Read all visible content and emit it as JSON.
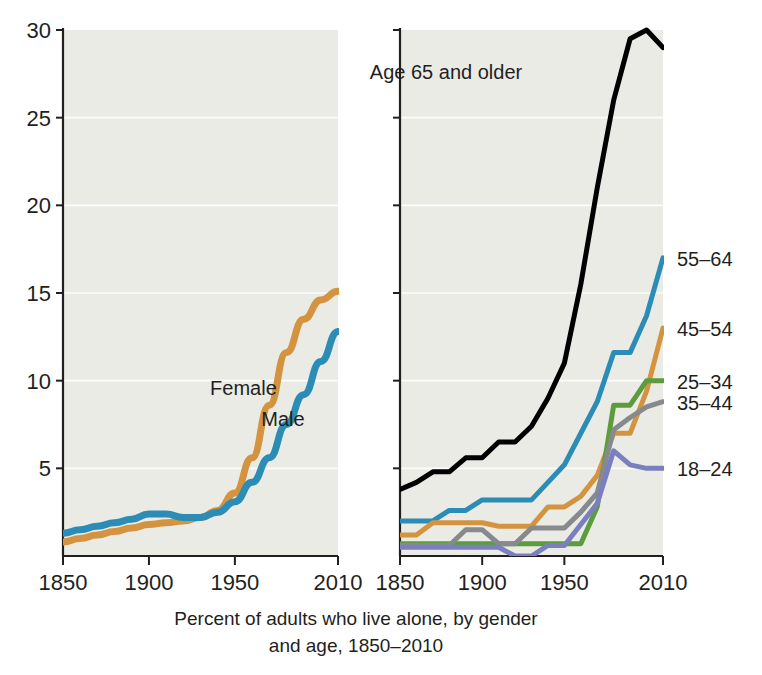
{
  "caption": {
    "line1": "Percent of adults who live alone, by gender",
    "line2": "and age, 1850–2010"
  },
  "axes": {
    "y_ticks": [
      "5",
      "10",
      "15",
      "20",
      "25",
      "30"
    ],
    "x_ticks": [
      "1850",
      "1900",
      "1950",
      "2010"
    ],
    "y_min": 0,
    "y_max": 30,
    "x_min": 1850,
    "x_max": 2010
  },
  "colors": {
    "orange": "#d4943f",
    "blue": "#2b8cb5",
    "black": "#000000",
    "green": "#5d9c3c",
    "gray": "#868a8c",
    "purple": "#7a80bf",
    "plot_background": "#ebebe6",
    "gridline": "#ffffff",
    "axis": "#231f20"
  },
  "chart_data": [
    {
      "type": "line",
      "title": "Percent of adults who live alone, by gender, 1850–2010",
      "xlabel": "",
      "ylabel": "Percent",
      "xlim": [
        1850,
        2010
      ],
      "ylim": [
        0,
        30
      ],
      "grid": true,
      "legend_position": "inline-labels",
      "x": [
        1850,
        1860,
        1870,
        1880,
        1890,
        1900,
        1910,
        1920,
        1930,
        1940,
        1950,
        1960,
        1970,
        1980,
        1990,
        2000,
        2010
      ],
      "series": [
        {
          "name": "Female",
          "color": "#d4943f",
          "label_x": 1955,
          "label_y": 9.2,
          "values": [
            0.8,
            1.0,
            1.2,
            1.4,
            1.6,
            1.8,
            1.9,
            2.0,
            2.2,
            2.6,
            3.6,
            5.6,
            8.6,
            11.6,
            13.5,
            14.6,
            15.1
          ]
        },
        {
          "name": "Male",
          "color": "#2b8cb5",
          "label_x": 1978,
          "label_y": 7.4,
          "values": [
            1.3,
            1.5,
            1.7,
            1.9,
            2.1,
            2.4,
            2.4,
            2.2,
            2.2,
            2.5,
            3.1,
            4.2,
            5.6,
            7.5,
            9.2,
            11.1,
            12.8
          ]
        }
      ]
    },
    {
      "type": "line",
      "title": "Percent of adults who live alone, by age, 1850–2010",
      "xlabel": "",
      "ylabel": "Percent",
      "xlim": [
        1850,
        2010
      ],
      "ylim": [
        0,
        30
      ],
      "grid": true,
      "legend_position": "right",
      "x": [
        1850,
        1860,
        1870,
        1880,
        1890,
        1900,
        1910,
        1920,
        1930,
        1940,
        1950,
        1960,
        1970,
        1980,
        1990,
        2000,
        2010
      ],
      "series": [
        {
          "name": "Age 65 and older",
          "color": "#000000",
          "label_x": 1878,
          "label_y": 27.2,
          "inline_label": true,
          "values": [
            3.8,
            4.2,
            4.8,
            4.8,
            5.6,
            5.6,
            6.5,
            6.5,
            7.4,
            9.0,
            11.0,
            15.5,
            21.0,
            26.0,
            29.5,
            30.0,
            29.0
          ]
        },
        {
          "name": "55–64",
          "color": "#2b8cb5",
          "label_x": 2010,
          "label_y": 17.0,
          "inline_label": false,
          "values": [
            2.0,
            2.0,
            2.0,
            2.6,
            2.6,
            3.2,
            3.2,
            3.2,
            3.2,
            4.2,
            5.2,
            7.0,
            8.8,
            11.6,
            11.6,
            13.7,
            17.0
          ]
        },
        {
          "name": "45–54",
          "color": "#d4943f",
          "label_x": 2010,
          "label_y": 13.0,
          "inline_label": false,
          "values": [
            1.2,
            1.2,
            1.9,
            1.9,
            1.9,
            1.9,
            1.7,
            1.7,
            1.7,
            2.8,
            2.8,
            3.4,
            4.6,
            7.0,
            7.0,
            9.4,
            13.0
          ]
        },
        {
          "name": "25–34",
          "color": "#5d9c3c",
          "label_x": 2010,
          "label_y": 10.0,
          "inline_label": false,
          "values": [
            0.7,
            0.7,
            0.7,
            0.7,
            0.7,
            0.7,
            0.7,
            0.7,
            0.7,
            0.7,
            0.7,
            0.7,
            2.8,
            8.6,
            8.6,
            10.0,
            10.0
          ]
        },
        {
          "name": "35–44",
          "color": "#868a8c",
          "label_x": 2010,
          "label_y": 8.8,
          "inline_label": false,
          "values": [
            0.6,
            0.6,
            0.6,
            0.6,
            1.5,
            1.5,
            0.7,
            0.7,
            1.6,
            1.6,
            1.6,
            2.5,
            3.6,
            7.2,
            7.9,
            8.5,
            8.8
          ]
        },
        {
          "name": "18–24",
          "color": "#7a80bf",
          "label_x": 2010,
          "label_y": 5.0,
          "inline_label": false,
          "values": [
            0.5,
            0.5,
            0.5,
            0.5,
            0.5,
            0.5,
            0.5,
            0.0,
            0.0,
            0.6,
            0.6,
            1.8,
            3.0,
            6.0,
            5.2,
            5.0,
            5.0
          ]
        }
      ]
    }
  ]
}
